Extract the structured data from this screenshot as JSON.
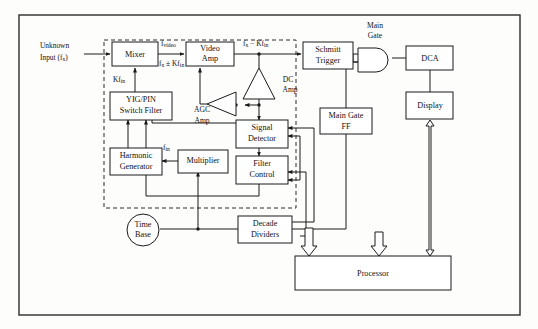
{
  "figure": {
    "type": "block-diagram",
    "frame": {
      "stroke": "#2b2b2b"
    },
    "background": "#fdfdfc"
  },
  "blocks": [
    {
      "id": "mixer",
      "label": "Mixer",
      "shape": "rect",
      "x": 112,
      "y": 42,
      "w": 46,
      "h": 24
    },
    {
      "id": "video_amp",
      "label": "Video\nAmp",
      "shape": "rect",
      "x": 186,
      "y": 42,
      "w": 48,
      "h": 24
    },
    {
      "id": "yig_pin",
      "label": "YIG/PIN\nSwitch Filter",
      "shape": "rect",
      "x": 110,
      "y": 92,
      "w": 62,
      "h": 26
    },
    {
      "id": "harmonic",
      "label": "Harmonic\nGenerator",
      "shape": "rect",
      "x": 110,
      "y": 148,
      "w": 50,
      "h": 26
    },
    {
      "id": "multiplier",
      "label": "Multiplier",
      "shape": "rect",
      "x": 178,
      "y": 150,
      "w": 48,
      "h": 22
    },
    {
      "id": "signal_det",
      "label": "Signal\nDetector",
      "shape": "rect",
      "x": 236,
      "y": 122,
      "w": 50,
      "h": 26
    },
    {
      "id": "filter_ctrl",
      "label": "Filter\nControl",
      "shape": "rect",
      "x": 236,
      "y": 158,
      "w": 50,
      "h": 26
    },
    {
      "id": "schmitt",
      "label": "Schmitt\nTrigger",
      "shape": "rect",
      "x": 303,
      "y": 42,
      "w": 50,
      "h": 26
    },
    {
      "id": "main_gate_ff",
      "label": "Main Gate\nFF",
      "shape": "rect",
      "x": 320,
      "y": 108,
      "w": 52,
      "h": 26
    },
    {
      "id": "dca",
      "label": "DCA",
      "shape": "rect",
      "x": 408,
      "y": 46,
      "w": 45,
      "h": 24
    },
    {
      "id": "display",
      "label": "Display",
      "shape": "rect",
      "x": 408,
      "y": 92,
      "w": 45,
      "h": 26
    },
    {
      "id": "decade_div",
      "label": "Decade\nDividers",
      "shape": "rect",
      "x": 238,
      "y": 216,
      "w": 52,
      "h": 26
    },
    {
      "id": "processor",
      "label": "Processor",
      "shape": "rect",
      "x": 295,
      "y": 256,
      "w": 155,
      "h": 34
    },
    {
      "id": "time_base",
      "label": "Time\nBase",
      "shape": "circle",
      "cx": 143,
      "cy": 230,
      "r": 16
    },
    {
      "id": "dc_amp",
      "label": "DC\nAmp",
      "shape": "triangle-up",
      "x": 244,
      "y": 68,
      "w": 31,
      "h": 31
    },
    {
      "id": "agc_amp",
      "label": "AGC\nAmp",
      "shape": "triangle-left",
      "x": 207,
      "y": 92,
      "w": 38,
      "h": 24
    },
    {
      "id": "main_gate",
      "label": "Main\nGate",
      "shape": "and-gate",
      "x": 358,
      "y": 48,
      "w": 32,
      "h": 24
    }
  ],
  "labels": {
    "unknown_input_l1": "Unknown",
    "unknown_input_l2": "Input (f",
    "unknown_input_sub": "x",
    "unknown_input_l3": ")",
    "f_video_main": "f",
    "f_video_sub": "video",
    "fx_plusminus_a": "f",
    "fx_plusminus_sub1": "x",
    "fx_plusminus_b": " ± Kf",
    "fx_plusminus_sub2": "in",
    "kfin_a": "Kf",
    "kfin_sub": "in",
    "fx_minus_a": "f",
    "fx_minus_sub1": "x",
    "fx_minus_b": " − Kf",
    "fx_minus_sub2": "in",
    "fin_a": "f",
    "fin_sub": "in",
    "main_gate_l1": "Main",
    "main_gate_l2": "Gate"
  },
  "block_text": {
    "mixer": "Mixer",
    "video_amp_l1": "Video",
    "video_amp_l2": "Amp",
    "yig_l1": "YIG/PIN",
    "yig_l2": "Switch Filter",
    "harmonic_l1": "Harmonic",
    "harmonic_l2": "Generator",
    "multiplier": "Multiplier",
    "signal_det_l1": "Signal",
    "signal_det_l2": "Detector",
    "filter_ctrl_l1": "Filter",
    "filter_ctrl_l2": "Control",
    "schmitt_l1": "Schmitt",
    "schmitt_l2": "Trigger",
    "main_gate_ff_l1": "Main Gate",
    "main_gate_ff_l2": "FF",
    "dca": "DCA",
    "display": "Display",
    "decade_l1": "Decade",
    "decade_l2": "Dividers",
    "processor": "Processor",
    "time_base_l1": "Time",
    "time_base_l2": "Base",
    "dc_amp_l1": "DC",
    "dc_amp_l2": "Amp",
    "agc_amp_l1": "AGC",
    "agc_amp_l2": "Amp"
  },
  "colors": {
    "line": "#1a1a1a",
    "frame": "#2b2b2b",
    "fill": "#ffffff",
    "page": "#fdfdfc"
  }
}
